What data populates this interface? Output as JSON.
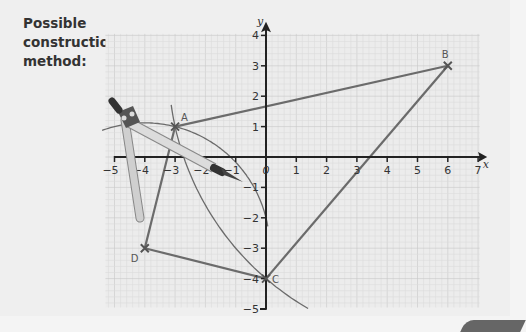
{
  "heading": "Possible\nconstruction\nmethod:",
  "chart_data": {
    "type": "scatter",
    "title": "Possible construction method:",
    "xlabel": "x",
    "ylabel": "y",
    "xlim": [
      -5,
      7
    ],
    "ylim": [
      -5,
      4
    ],
    "x_ticks": [
      -5,
      -4,
      -3,
      -2,
      -1,
      0,
      1,
      2,
      3,
      4,
      5,
      6,
      7
    ],
    "x_tick_labels": [
      "−5",
      "−4",
      "−3",
      "−2",
      "−1",
      "0",
      "1",
      "2",
      "3",
      "4",
      "5",
      "6",
      "7"
    ],
    "y_ticks": [
      -5,
      -4,
      -3,
      -2,
      -1,
      1,
      2,
      3,
      4
    ],
    "y_tick_labels": [
      "−5",
      "−4",
      "−3",
      "−2",
      "−1",
      "1",
      "2",
      "3",
      "4"
    ],
    "grid": true,
    "points": [
      {
        "label": "A",
        "x": -3,
        "y": 1
      },
      {
        "label": "B",
        "x": 6,
        "y": 3
      },
      {
        "label": "C",
        "x": 0,
        "y": -4
      },
      {
        "label": "D",
        "x": -4,
        "y": -3
      }
    ],
    "segments": [
      [
        "A",
        "B"
      ],
      [
        "B",
        "C"
      ],
      [
        "C",
        "D"
      ],
      [
        "D",
        "A"
      ]
    ],
    "arcs": [
      {
        "center": "B",
        "radius_through": "A",
        "from_deg": 188,
        "to_deg": 240
      },
      {
        "center": "D",
        "radius_through": "A",
        "from_deg": 10,
        "to_deg": 110
      }
    ],
    "annotations": [
      "compass drawing arc from A"
    ]
  },
  "colors": {
    "line": "#6b6b6b",
    "axis": "#222222",
    "grid_minor": "#dcdcdc",
    "grid_major": "#c8c8c8",
    "compass_arm": "#c8c8c8",
    "compass_dark": "#444444"
  }
}
